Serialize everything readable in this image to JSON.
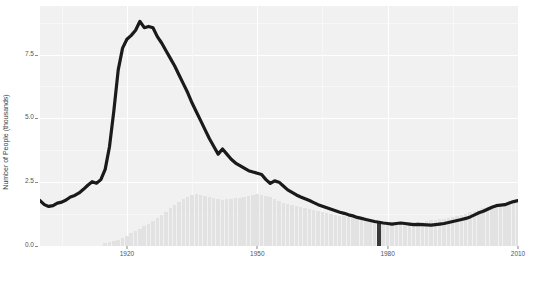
{
  "chart_data": {
    "type": "bar",
    "title": "",
    "subtitle": "",
    "xlabel": "",
    "ylabel": "Number of People (thousands)",
    "xlim": [
      1900,
      2010
    ],
    "ylim": [
      0,
      9.4
    ],
    "grid": true,
    "legend": "none",
    "y_ticks": [
      "0.0",
      "2.5",
      "5.0",
      "7.5"
    ],
    "y_tick_values": [
      0.0,
      2.5,
      5.0,
      7.5
    ],
    "x_ticks": [
      "1920",
      "1950",
      "1980",
      "2010"
    ],
    "x_tick_values": [
      1920,
      1950,
      1980,
      2010
    ],
    "series": [
      {
        "name": "line",
        "type": "line",
        "color": "#1a1a1a",
        "x": [
          1900,
          1901,
          1902,
          1903,
          1904,
          1905,
          1906,
          1907,
          1908,
          1909,
          1910,
          1911,
          1912,
          1913,
          1914,
          1915,
          1916,
          1917,
          1918,
          1919,
          1920,
          1921,
          1922,
          1923,
          1924,
          1925,
          1926,
          1927,
          1928,
          1929,
          1930,
          1931,
          1932,
          1933,
          1934,
          1935,
          1936,
          1937,
          1938,
          1939,
          1940,
          1941,
          1942,
          1943,
          1944,
          1945,
          1946,
          1947,
          1948,
          1949,
          1950,
          1951,
          1952,
          1953,
          1954,
          1955,
          1956,
          1957,
          1958,
          1959,
          1960,
          1961,
          1962,
          1963,
          1964,
          1965,
          1966,
          1967,
          1968,
          1969,
          1970,
          1971,
          1972,
          1973,
          1974,
          1975,
          1976,
          1977,
          1978,
          1979,
          1980,
          1981,
          1982,
          1983,
          1984,
          1985,
          1986,
          1987,
          1988,
          1989,
          1990,
          1991,
          1992,
          1993,
          1994,
          1995,
          1996,
          1997,
          1998,
          1999,
          2000,
          2001,
          2002,
          2003,
          2004,
          2005,
          2006,
          2007,
          2008,
          2009,
          2010
        ],
        "values": [
          1.78,
          1.62,
          1.55,
          1.58,
          1.68,
          1.72,
          1.8,
          1.92,
          1.98,
          2.08,
          2.22,
          2.38,
          2.52,
          2.46,
          2.6,
          3.0,
          3.9,
          5.3,
          6.9,
          7.75,
          8.1,
          8.25,
          8.45,
          8.8,
          8.55,
          8.6,
          8.55,
          8.2,
          7.95,
          7.65,
          7.35,
          7.05,
          6.7,
          6.35,
          6.0,
          5.6,
          5.25,
          4.9,
          4.55,
          4.2,
          3.9,
          3.6,
          3.8,
          3.6,
          3.4,
          3.25,
          3.15,
          3.05,
          2.95,
          2.9,
          2.85,
          2.8,
          2.6,
          2.45,
          2.55,
          2.5,
          2.35,
          2.2,
          2.1,
          2.0,
          1.92,
          1.85,
          1.78,
          1.7,
          1.62,
          1.56,
          1.5,
          1.44,
          1.38,
          1.32,
          1.28,
          1.22,
          1.18,
          1.12,
          1.08,
          1.04,
          1.0,
          0.96,
          0.93,
          0.9,
          0.88,
          0.86,
          0.88,
          0.9,
          0.88,
          0.86,
          0.84,
          0.85,
          0.84,
          0.83,
          0.82,
          0.84,
          0.86,
          0.88,
          0.92,
          0.96,
          1.0,
          1.04,
          1.08,
          1.14,
          1.22,
          1.3,
          1.36,
          1.44,
          1.52,
          1.58,
          1.6,
          1.62,
          1.68,
          1.74,
          1.78
        ]
      },
      {
        "name": "bars",
        "type": "bar",
        "color": "#e2e2e2",
        "highlight_color": "#3a3a3a",
        "highlight_year": 1978,
        "x": [
          1915,
          1916,
          1917,
          1918,
          1919,
          1920,
          1921,
          1922,
          1923,
          1924,
          1925,
          1926,
          1927,
          1928,
          1929,
          1930,
          1931,
          1932,
          1933,
          1934,
          1935,
          1936,
          1937,
          1938,
          1939,
          1940,
          1941,
          1942,
          1943,
          1944,
          1945,
          1946,
          1947,
          1948,
          1949,
          1950,
          1951,
          1952,
          1953,
          1954,
          1955,
          1956,
          1957,
          1958,
          1959,
          1960,
          1961,
          1962,
          1963,
          1964,
          1965,
          1966,
          1967,
          1968,
          1969,
          1970,
          1971,
          1972,
          1973,
          1974,
          1975,
          1976,
          1977,
          1978,
          1979,
          1980,
          1981,
          1982,
          1983,
          1984,
          1985,
          1986,
          1987,
          1988,
          1989,
          1990,
          1991,
          1992,
          1993,
          1994,
          1995,
          1996,
          1997,
          1998,
          1999,
          2000,
          2001,
          2002,
          2003,
          2004,
          2005,
          2006,
          2007,
          2008,
          2009,
          2010
        ],
        "values": [
          0.1,
          0.14,
          0.18,
          0.24,
          0.3,
          0.4,
          0.5,
          0.58,
          0.66,
          0.78,
          0.88,
          0.98,
          1.1,
          1.22,
          1.34,
          1.48,
          1.6,
          1.72,
          1.84,
          1.92,
          1.98,
          2.02,
          1.98,
          1.94,
          1.92,
          1.88,
          1.84,
          1.82,
          1.84,
          1.86,
          1.88,
          1.9,
          1.92,
          1.96,
          2.0,
          2.02,
          2.0,
          1.96,
          1.92,
          1.84,
          1.76,
          1.7,
          1.64,
          1.62,
          1.58,
          1.52,
          1.48,
          1.44,
          1.4,
          1.36,
          1.32,
          1.28,
          1.26,
          1.22,
          1.18,
          1.16,
          1.12,
          1.1,
          1.06,
          1.04,
          1.02,
          1.0,
          0.98,
          0.96,
          0.96,
          0.94,
          0.94,
          0.94,
          0.94,
          0.94,
          0.94,
          0.94,
          0.96,
          0.96,
          0.98,
          1.0,
          1.02,
          1.04,
          1.06,
          1.1,
          1.14,
          1.18,
          1.22,
          1.26,
          1.32,
          1.38,
          1.42,
          1.48,
          1.52,
          1.58,
          1.62,
          1.66,
          1.7,
          1.74,
          1.78,
          1.8
        ]
      }
    ]
  },
  "axis": {
    "ylabel": "Number of People (thousands)",
    "xlabel": ""
  }
}
